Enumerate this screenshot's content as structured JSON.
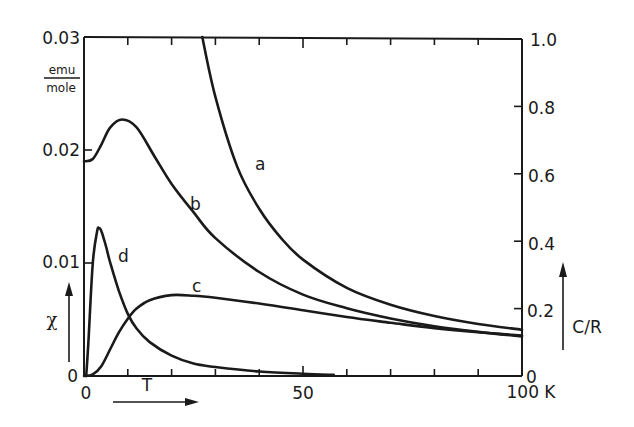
{
  "chart_data": {
    "type": "line",
    "title": "",
    "xlabel": "T",
    "x_unit": "K",
    "xlim": [
      0,
      100
    ],
    "x_ticks": [
      0,
      10,
      20,
      30,
      40,
      50,
      60,
      70,
      80,
      90,
      100
    ],
    "x_tick_labels": [
      "0",
      "50",
      "100 K"
    ],
    "y_left": {
      "label": "χ",
      "unit_numerator": "emu",
      "unit_denominator": "mole",
      "ylim": [
        0,
        0.03
      ],
      "ticks": [
        0,
        0.01,
        0.02,
        0.03
      ],
      "tick_labels": [
        "0",
        "0.01",
        "0.02",
        "0.03"
      ]
    },
    "y_right": {
      "label": "C/R",
      "ylim": [
        0,
        1.0
      ],
      "ticks": [
        0,
        0.2,
        0.4,
        0.6,
        0.8,
        1.0
      ],
      "tick_labels": [
        "0",
        "0.2",
        "0.4",
        "0.6",
        "0.8",
        "1.0"
      ]
    },
    "grid": false,
    "legend": "inline curve labels",
    "series": [
      {
        "name": "a",
        "axis": "left (χ)",
        "x": [
          27,
          30,
          35,
          40,
          45,
          50,
          60,
          70,
          80,
          90,
          100
        ],
        "y": [
          0.03,
          0.0247,
          0.0185,
          0.0148,
          0.0122,
          0.0103,
          0.0078,
          0.0063,
          0.0053,
          0.0046,
          0.0041
        ]
      },
      {
        "name": "b",
        "axis": "left (χ)",
        "x": [
          0,
          2,
          4,
          6,
          8.7,
          12,
          16,
          20,
          25,
          30,
          40,
          50,
          60,
          70,
          80,
          90,
          100
        ],
        "y": [
          0.019,
          0.0192,
          0.0205,
          0.022,
          0.0227,
          0.022,
          0.0195,
          0.017,
          0.0145,
          0.0122,
          0.0092,
          0.0072,
          0.006,
          0.0051,
          0.0044,
          0.0039,
          0.0035
        ]
      },
      {
        "name": "c",
        "axis": "right (C/R)",
        "x": [
          0,
          2,
          4,
          6,
          8,
          10,
          12,
          15,
          20,
          25,
          30,
          40,
          50,
          60,
          70,
          80,
          90,
          100
        ],
        "y": [
          0.0,
          0.005,
          0.03,
          0.08,
          0.13,
          0.17,
          0.2,
          0.225,
          0.24,
          0.238,
          0.232,
          0.215,
          0.195,
          0.175,
          0.158,
          0.142,
          0.13,
          0.12
        ]
      },
      {
        "name": "d",
        "axis": "left (χ)",
        "x": [
          0.5,
          1,
          2,
          3,
          3.4,
          4,
          5,
          6,
          8,
          10,
          12,
          15,
          20,
          25,
          30,
          40,
          50,
          57
        ],
        "y": [
          0.0,
          0.003,
          0.01,
          0.0128,
          0.0131,
          0.0128,
          0.0115,
          0.01,
          0.0075,
          0.0055,
          0.0042,
          0.003,
          0.0018,
          0.0011,
          0.0008,
          0.0004,
          0.0002,
          0.0001
        ]
      }
    ]
  },
  "labels": {
    "left_top": "0.03",
    "left_02": "0.02",
    "left_01": "0.01",
    "left_0": "0",
    "unit_num": "emu",
    "unit_den": "mole",
    "chi": "χ",
    "x_0": "0",
    "x_50": "50",
    "x_100": "100 K",
    "t_label": "T",
    "right_10": "1.0",
    "right_08": "0.8",
    "right_06": "0.6",
    "right_04": "0.4",
    "right_02": "0.2",
    "right_0": "0",
    "cr": "C/R",
    "curve_a": "a",
    "curve_b": "b",
    "curve_c": "c",
    "curve_d": "d"
  },
  "style": {
    "ink": "#1a1a1a",
    "background": "#ffffff"
  }
}
